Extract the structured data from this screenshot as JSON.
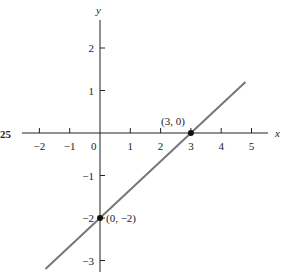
{
  "figure_label": "25",
  "chart_data": {
    "type": "line",
    "title": "",
    "xlabel": "x",
    "ylabel": "y",
    "xlim": [
      -2.5,
      5.5
    ],
    "ylim": [
      -3.3,
      2.7
    ],
    "x_ticks": [
      -2,
      -1,
      1,
      2,
      3,
      4,
      5
    ],
    "x_tick_labels": [
      "−2",
      "−1",
      "1",
      "2",
      "3",
      "4",
      "5"
    ],
    "y_ticks": [
      2,
      1,
      -1,
      -2,
      -3
    ],
    "y_tick_labels": [
      "2",
      "1",
      "−1",
      "−2",
      "−3"
    ],
    "origin_label": "0",
    "grid": false,
    "series": [
      {
        "name": "line",
        "equation": "y = (2/3)x - 2",
        "x": [
          -1.8,
          4.8
        ],
        "y": [
          -3.2,
          1.2
        ],
        "color": "#777777"
      }
    ],
    "points": [
      {
        "x": 3,
        "y": 0,
        "label": "(3, 0)"
      },
      {
        "x": 0,
        "y": -2,
        "label": "(0, −2)"
      }
    ]
  }
}
